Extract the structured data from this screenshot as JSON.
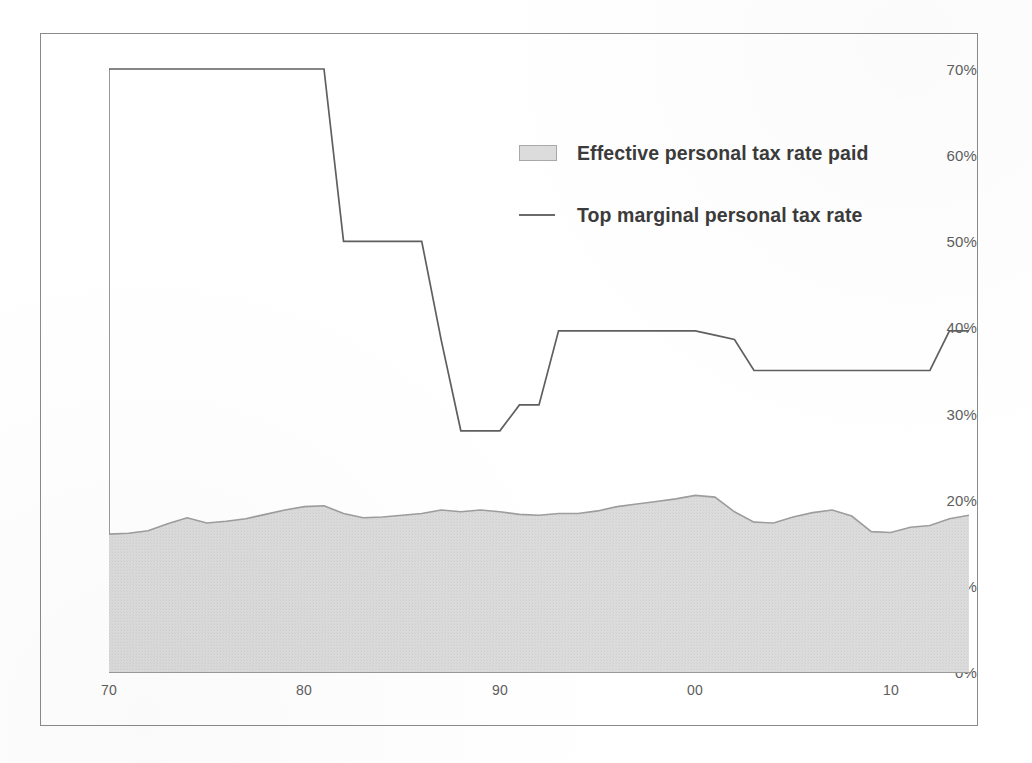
{
  "chart_data": {
    "type": "area",
    "title": "",
    "subtitle": "",
    "xlabel": "",
    "ylabel": "",
    "xlim": [
      1970,
      2014
    ],
    "ylim": [
      0,
      70
    ],
    "grid": false,
    "legend_position": "upper-center-right",
    "y_ticks": [
      "0%",
      "10%",
      "20%",
      "30%",
      "40%",
      "50%",
      "60%",
      "70%"
    ],
    "y_tick_values": [
      0,
      10,
      20,
      30,
      40,
      50,
      60,
      70
    ],
    "x_ticks": [
      "70",
      "80",
      "90",
      "00",
      "10"
    ],
    "x_tick_values": [
      1970,
      1980,
      1990,
      2000,
      2010
    ],
    "x": [
      1970,
      1971,
      1972,
      1973,
      1974,
      1975,
      1976,
      1977,
      1978,
      1979,
      1980,
      1981,
      1982,
      1983,
      1984,
      1985,
      1986,
      1987,
      1988,
      1989,
      1990,
      1991,
      1992,
      1993,
      1994,
      1995,
      1996,
      1997,
      1998,
      1999,
      2000,
      2001,
      2002,
      2003,
      2004,
      2005,
      2006,
      2007,
      2008,
      2009,
      2010,
      2011,
      2012,
      2013,
      2014
    ],
    "series": [
      {
        "name": "Effective personal tax rate paid",
        "type": "area",
        "color": "#d9d9d9",
        "edge_color": "#9d9d9d",
        "values": [
          16.0,
          16.1,
          16.4,
          17.2,
          17.9,
          17.3,
          17.5,
          17.8,
          18.3,
          18.8,
          19.2,
          19.3,
          18.4,
          17.9,
          18.0,
          18.2,
          18.4,
          18.8,
          18.6,
          18.8,
          18.6,
          18.3,
          18.2,
          18.4,
          18.4,
          18.7,
          19.2,
          19.5,
          19.8,
          20.1,
          20.5,
          20.3,
          18.6,
          17.4,
          17.3,
          18.0,
          18.5,
          18.8,
          18.1,
          16.3,
          16.2,
          16.8,
          17.0,
          17.8,
          18.2
        ]
      },
      {
        "name": "Top marginal personal tax rate",
        "type": "line",
        "color": "#5f5f5f",
        "values": [
          70,
          70,
          70,
          70,
          70,
          70,
          70,
          70,
          70,
          70,
          70,
          70,
          50,
          50,
          50,
          50,
          50,
          38.5,
          28,
          28,
          28,
          31,
          31,
          39.6,
          39.6,
          39.6,
          39.6,
          39.6,
          39.6,
          39.6,
          39.6,
          39.1,
          38.6,
          35,
          35,
          35,
          35,
          35,
          35,
          35,
          35,
          35,
          35,
          39.6,
          39.6
        ]
      }
    ]
  },
  "legend": {
    "items": [
      {
        "label": "Effective personal tax rate paid",
        "marker": "area-swatch"
      },
      {
        "label": "Top marginal personal tax rate",
        "marker": "line-dash"
      }
    ]
  },
  "colors": {
    "area_fill": "#d9d9d9",
    "area_edge": "#9d9d9d",
    "line": "#5f5f5f",
    "axis": "#9a9a9a",
    "tick_text": "#5d5d5d",
    "legend_text": "#3b3b3b",
    "frame_border": "#8a8a8a",
    "background": "#ffffff"
  }
}
